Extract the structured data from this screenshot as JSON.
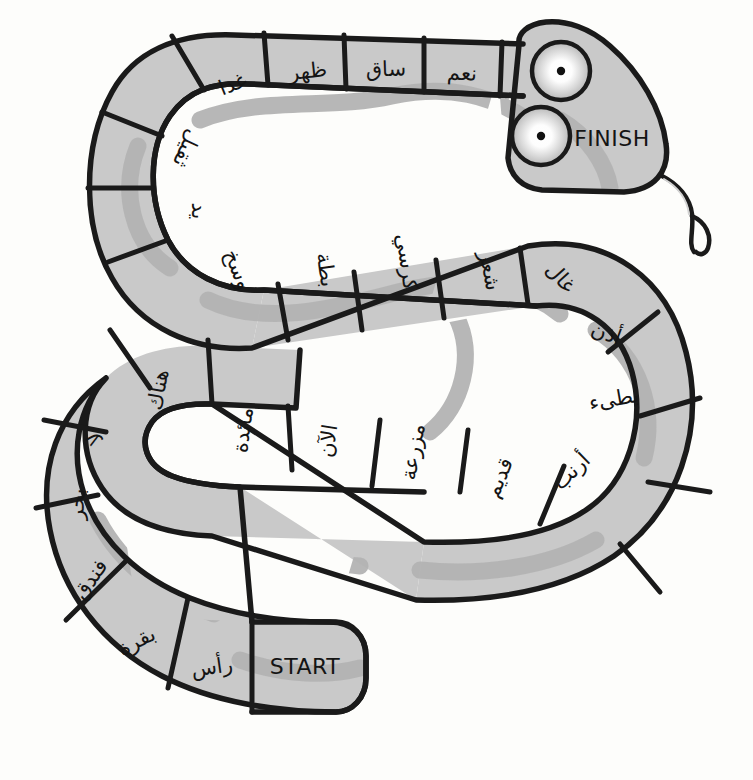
{
  "board": {
    "title": "Arabic word snake board game",
    "start_label": "START",
    "finish_label": "FINISH",
    "colors": {
      "background": "#fdfdfb",
      "body_fill": "#c9c9c9",
      "outline": "#1a1a1a",
      "pattern": "#b3b3b3",
      "text": "#141414"
    },
    "spaces": [
      {
        "index": 1,
        "label": "START",
        "script": "latin"
      },
      {
        "index": 2,
        "label": "رأس",
        "script": "arabic"
      },
      {
        "index": 3,
        "label": "بقرة",
        "script": "arabic"
      },
      {
        "index": 4,
        "label": "فندق",
        "script": "arabic"
      },
      {
        "index": 5,
        "label": "بحر",
        "script": "arabic"
      },
      {
        "index": 6,
        "label": "لا",
        "script": "arabic"
      },
      {
        "index": 7,
        "label": "هناك",
        "script": "arabic"
      },
      {
        "index": 8,
        "label": "مائدة",
        "script": "arabic"
      },
      {
        "index": 9,
        "label": "الآن",
        "script": "arabic"
      },
      {
        "index": 10,
        "label": "مزرعة",
        "script": "arabic"
      },
      {
        "index": 11,
        "label": "قديم",
        "script": "arabic"
      },
      {
        "index": 12,
        "label": "أرنب",
        "script": "arabic"
      },
      {
        "index": 13,
        "label": "بطىء",
        "script": "arabic"
      },
      {
        "index": 14,
        "label": "أذن",
        "script": "arabic"
      },
      {
        "index": 15,
        "label": "غال",
        "script": "arabic"
      },
      {
        "index": 16,
        "label": "شعر",
        "script": "arabic"
      },
      {
        "index": 17,
        "label": "كرسي",
        "script": "arabic"
      },
      {
        "index": 18,
        "label": "بطة",
        "script": "arabic"
      },
      {
        "index": 19,
        "label": "وسخ",
        "script": "arabic"
      },
      {
        "index": 20,
        "label": "يد",
        "script": "arabic"
      },
      {
        "index": 21,
        "label": "ثقيل",
        "script": "arabic"
      },
      {
        "index": 22,
        "label": "غدا",
        "script": "arabic"
      },
      {
        "index": 23,
        "label": "ظهر",
        "script": "arabic"
      },
      {
        "index": 24,
        "label": "ساق",
        "script": "arabic"
      },
      {
        "index": 25,
        "label": "نعم",
        "script": "arabic"
      },
      {
        "index": 26,
        "label": "FINISH",
        "script": "latin"
      }
    ]
  }
}
